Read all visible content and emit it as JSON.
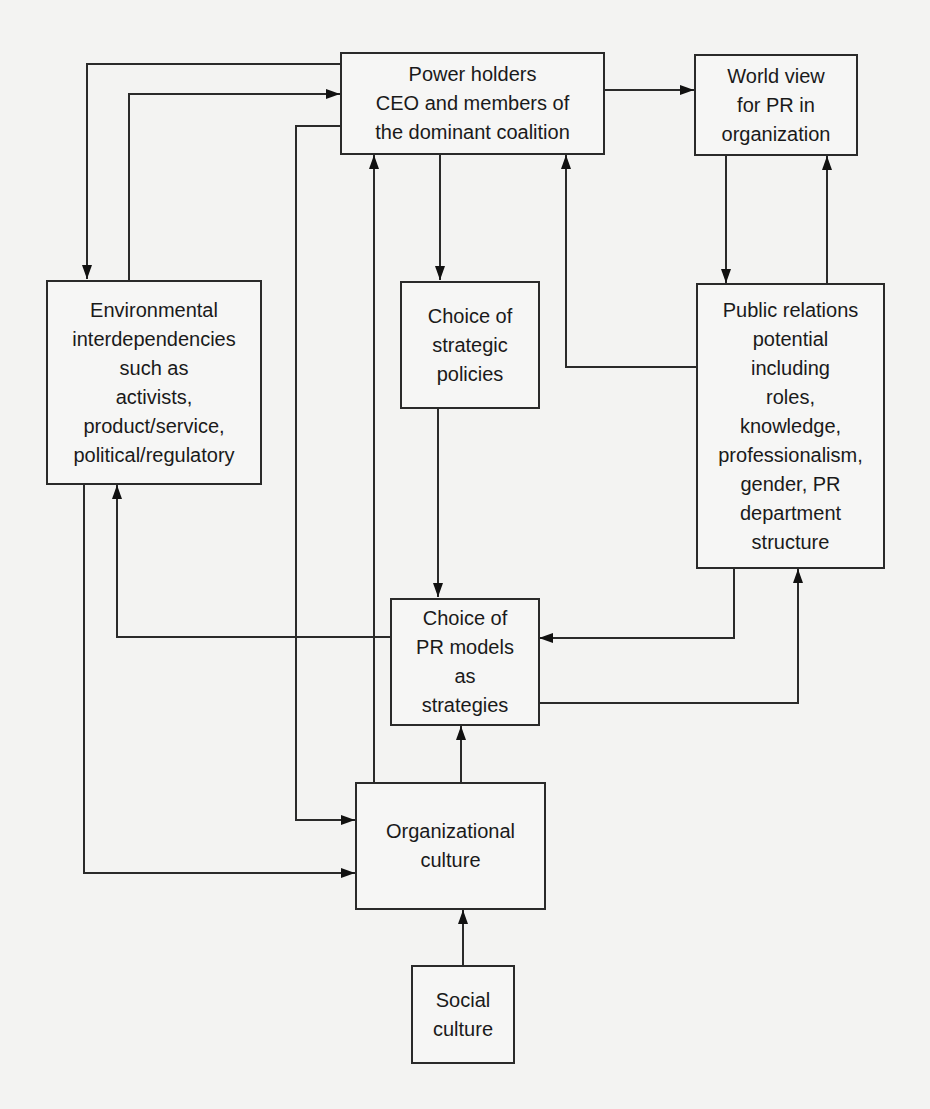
{
  "diagram": {
    "nodes": {
      "power_holders": {
        "lines": [
          "Power holders",
          "CEO and members of",
          "the dominant coalition"
        ]
      },
      "world_view": {
        "lines": [
          "World view",
          "for PR in",
          "organization"
        ]
      },
      "environmental": {
        "lines": [
          "Environmental",
          "interdependencies",
          "such as",
          "activists,",
          "product/service,",
          "political/regulatory"
        ]
      },
      "strategic_policies": {
        "lines": [
          "Choice of",
          "strategic",
          "policies"
        ]
      },
      "pr_potential": {
        "lines": [
          "Public relations",
          "potential",
          "including",
          "roles,",
          "knowledge,",
          "professionalism,",
          "gender, PR",
          "department",
          "structure"
        ]
      },
      "pr_models": {
        "lines": [
          "Choice of",
          "PR models",
          "as",
          "strategies"
        ]
      },
      "org_culture": {
        "lines": [
          "Organizational",
          "culture"
        ]
      },
      "social_culture": {
        "lines": [
          "Social",
          "culture"
        ]
      }
    },
    "edges": [
      {
        "from": "power_holders",
        "to": "environmental"
      },
      {
        "from": "environmental",
        "to": "power_holders"
      },
      {
        "from": "power_holders",
        "to": "world_view"
      },
      {
        "from": "power_holders",
        "to": "strategic_policies"
      },
      {
        "from": "power_holders",
        "to": "org_culture"
      },
      {
        "from": "org_culture",
        "to": "power_holders"
      },
      {
        "from": "world_view",
        "to": "pr_potential"
      },
      {
        "from": "pr_potential",
        "to": "world_view"
      },
      {
        "from": "pr_potential",
        "to": "power_holders"
      },
      {
        "from": "strategic_policies",
        "to": "pr_models"
      },
      {
        "from": "pr_potential",
        "to": "pr_models"
      },
      {
        "from": "pr_models",
        "to": "pr_potential"
      },
      {
        "from": "pr_models",
        "to": "environmental"
      },
      {
        "from": "environmental",
        "to": "org_culture"
      },
      {
        "from": "org_culture",
        "to": "pr_models"
      },
      {
        "from": "social_culture",
        "to": "org_culture"
      }
    ]
  }
}
